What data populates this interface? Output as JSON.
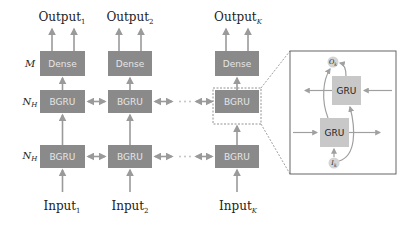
{
  "diagram": {
    "row_labels": {
      "dense": "M",
      "bgru_upper": "N",
      "bgru_upper_sub": "H",
      "bgru_lower": "N",
      "bgru_lower_sub": "H"
    },
    "columns": [
      {
        "output_label": "Output",
        "output_sub": "1",
        "dense_label": "Dense",
        "bgru_upper_label": "BGRU",
        "bgru_lower_label": "BGRU",
        "input_label": "Input",
        "input_sub": "1"
      },
      {
        "output_label": "Output",
        "output_sub": "2",
        "dense_label": "Dense",
        "bgru_upper_label": "BGRU",
        "bgru_lower_label": "BGRU",
        "input_label": "Input",
        "input_sub": "2"
      },
      {
        "output_label": "Output",
        "output_sub": "K",
        "dense_label": "Dense",
        "bgru_upper_label": "BGRU",
        "bgru_lower_label": "BGRU",
        "input_label": "Input",
        "input_sub": "K"
      }
    ],
    "ellipsis": "· · ·",
    "zoom_panel": {
      "gru_top_label": "GRU",
      "gru_bottom_label": "GRU",
      "output_node": "O",
      "output_node_sub": "k",
      "input_node": "I",
      "input_node_sub": "k"
    },
    "colors": {
      "box_fill": "#8a8a8a",
      "box_text": "#e6e6e6",
      "gru_fill": "#c8c8c8",
      "arrow": "#9a9a9a",
      "node_fill": "#d4d4d4"
    }
  }
}
